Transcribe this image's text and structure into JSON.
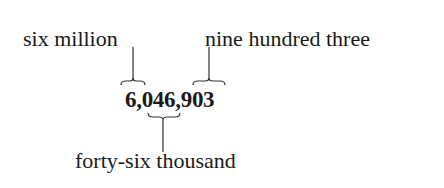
{
  "diagram": {
    "number": "6,046,903",
    "labels": {
      "millions": "six million",
      "ones": "nine hundred three",
      "thousands": "forty-six thousand"
    },
    "groups": [
      {
        "digits": "6",
        "meaning": "six million",
        "position": "above"
      },
      {
        "digits": "046",
        "meaning": "forty-six thousand",
        "position": "below"
      },
      {
        "digits": "903",
        "meaning": "nine hundred three",
        "position": "above"
      }
    ]
  }
}
